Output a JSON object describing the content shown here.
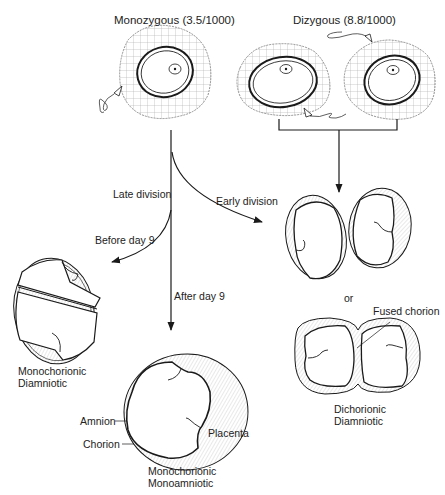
{
  "diagram": {
    "titles": {
      "monozygous": "Monozygous (3.5/1000)",
      "dizygous": "Dizygous (8.8/1000)"
    },
    "branches": {
      "late_division": "Late division",
      "early_division": "Early division",
      "before_day_9": "Before day 9",
      "after_day_9": "After day 9",
      "or": "or"
    },
    "outcomes": {
      "mono_di": [
        "Monochorionic",
        "Diamniotic"
      ],
      "mono_mono": [
        "Monochorionic",
        "Monoamniotic"
      ],
      "di_di": [
        "Dichorionic",
        "Diamniotic"
      ]
    },
    "annotations": {
      "amnion": "Amnion",
      "chorion": "Chorion",
      "placenta": "Placenta",
      "fused_chorion": "Fused chorion"
    },
    "colors": {
      "line": "#1a1a1a",
      "hatch": "#9a9a9a",
      "background": "#ffffff"
    }
  }
}
